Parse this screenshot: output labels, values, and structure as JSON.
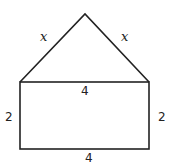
{
  "diagram": {
    "shape": "house (triangle on rectangle)",
    "stroke_color": "#222222",
    "background": "#ffffff",
    "triangle": {
      "apex": [
        85,
        14
      ],
      "left": [
        20,
        82
      ],
      "right": [
        149,
        82
      ],
      "left_side_label": "x",
      "right_side_label": "x"
    },
    "rectangle": {
      "top_left": [
        20,
        82
      ],
      "bottom_right": [
        149,
        149
      ],
      "top_label": "4",
      "bottom_label": "4",
      "left_label": "2",
      "right_label": "2"
    }
  }
}
